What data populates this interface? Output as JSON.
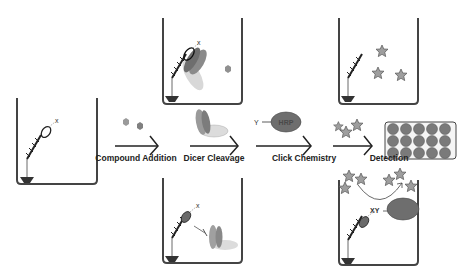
{
  "diagram": {
    "steps": [
      {
        "label": "Compound Addition",
        "x": 136
      },
      {
        "label": "Dicer Cleavage",
        "x": 214
      },
      {
        "label": "Click Chemistry",
        "x": 304
      },
      {
        "label": "Detection",
        "x": 389
      }
    ],
    "reagent_label": "HRP",
    "tag_y": "Y",
    "tag_x": "X",
    "tag_xy": "XY",
    "plate": {
      "rows": 3,
      "cols": 5
    },
    "colors": {
      "outline": "#222222",
      "compound": "#8c8c8c",
      "dicer_dark": "#7a7a7a",
      "dicer_light": "#d0d0d0",
      "hrp": "#6e6e6e",
      "star": "#9a9a9a",
      "well": "#6a6a6a"
    }
  }
}
